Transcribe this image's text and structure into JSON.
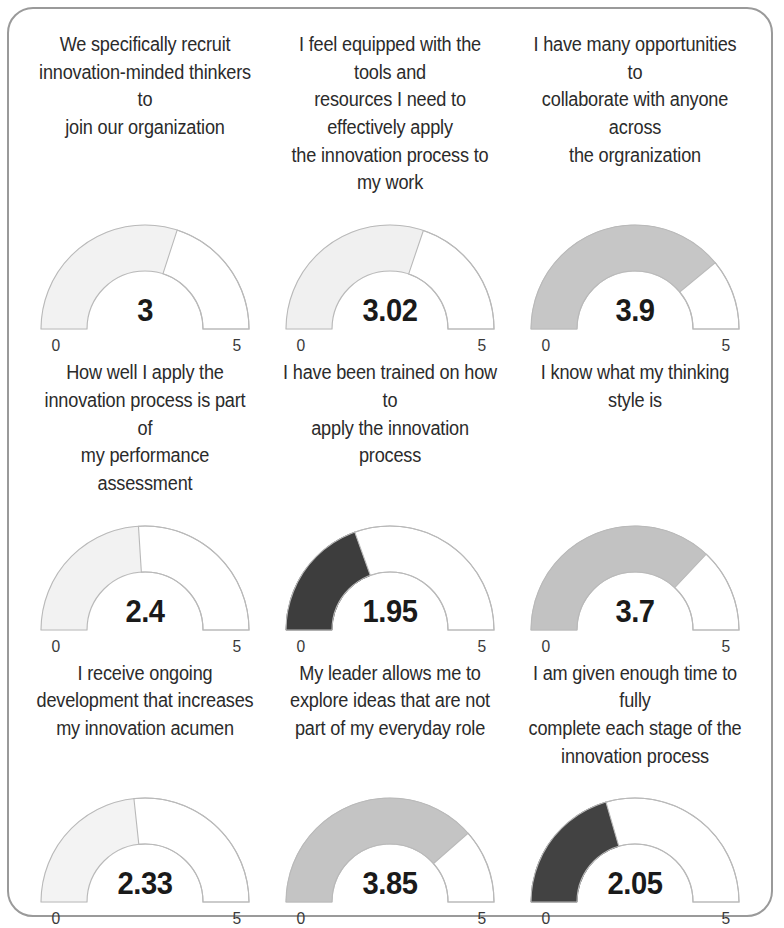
{
  "card": {
    "border_color": "#9a9a9a",
    "background": "#ffffff"
  },
  "gauge_defaults": {
    "min_label": "0",
    "max_label": "5",
    "scale_min": 0,
    "scale_max": 5,
    "track_color": "#ffffff",
    "track_stroke": "#b9b9b9"
  },
  "chart_data": {
    "type": "gauge",
    "title": "",
    "scale_min": 0,
    "scale_max": 5,
    "axis_tick_labels": [
      "0",
      "5"
    ],
    "grid": false,
    "legend": null,
    "units": "average rating (1-5)",
    "gauges": [
      {
        "id": "recruit-innovation-minded",
        "label": "We specifically recruit\ninnovation-minded thinkers to\njoin our organization",
        "value": 3,
        "value_label": "3",
        "fill_color": "#f2f2f2",
        "min_label": "0",
        "max_label": "5"
      },
      {
        "id": "equipped-with-tools",
        "label": "I feel equipped with the tools and\nresources I need to effectively apply\nthe innovation process to my work",
        "value": 3.02,
        "value_label": "3.02",
        "fill_color": "#f0f0f0",
        "min_label": "0",
        "max_label": "5"
      },
      {
        "id": "opportunities-to-collaborate",
        "label": "I have many opportunities to\ncollaborate with anyone across\nthe orgranization",
        "value": 3.9,
        "value_label": "3.9",
        "fill_color": "#c6c6c6",
        "min_label": "0",
        "max_label": "5"
      },
      {
        "id": "performance-assessment",
        "label": "How well I apply the\ninnovation process is part of\nmy performance assessment",
        "value": 2.4,
        "value_label": "2.4",
        "fill_color": "#f2f2f2",
        "min_label": "0",
        "max_label": "5"
      },
      {
        "id": "been-trained",
        "label": "I have been trained on how to\napply the innovation process",
        "value": 1.95,
        "value_label": "1.95",
        "fill_color": "#3d3d3d",
        "min_label": "0",
        "max_label": "5"
      },
      {
        "id": "thinking-style",
        "label": "I know what my thinking style is",
        "value": 3.7,
        "value_label": "3.7",
        "fill_color": "#c2c2c2",
        "min_label": "0",
        "max_label": "5"
      },
      {
        "id": "ongoing-development",
        "label": "I receive ongoing\ndevelopment that increases\nmy innovation acumen",
        "value": 2.33,
        "value_label": "2.33",
        "fill_color": "#f3f3f3",
        "min_label": "0",
        "max_label": "5"
      },
      {
        "id": "leader-allows-explore",
        "label": "My leader allows me to\nexplore ideas that are not\npart of my everyday role",
        "value": 3.85,
        "value_label": "3.85",
        "fill_color": "#c4c4c4",
        "min_label": "0",
        "max_label": "5"
      },
      {
        "id": "enough-time-each-stage",
        "label": "I am given enough time to fully\ncomplete each stage of the\ninnovation process",
        "value": 2.05,
        "value_label": "2.05",
        "fill_color": "#424242",
        "min_label": "0",
        "max_label": "5"
      }
    ]
  }
}
